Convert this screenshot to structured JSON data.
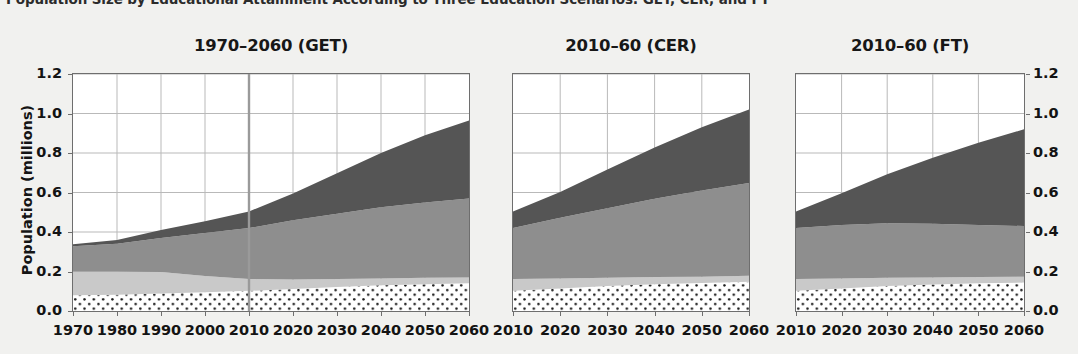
{
  "figure": {
    "title": "Population Size by Educational Attainment According to Three Education Scenarios: GET, CER, and FT",
    "y_axis_label": "Population (millions)",
    "background_color": "#f1f1ef",
    "panel_background": "#ffffff",
    "axis_color": "#6e6e6e",
    "gridline_color": "#b9b9b9"
  },
  "legend_colors": {
    "no_education_or_primary": "#ffffff-with-black-dots",
    "lower_secondary": "#c9c9c9",
    "upper_secondary": "#8e8e8e",
    "post_secondary": "#555555"
  },
  "chart_data": {
    "type": "area",
    "title": "Population Size by Educational Attainment According to Three Education Scenarios: GET, CER, and FT",
    "xlabel": "",
    "ylabel": "Population (millions)",
    "ylim": [
      0.0,
      1.2
    ],
    "yticks": [
      "0.0",
      "0.2",
      "0.4",
      "0.6",
      "0.8",
      "1.0",
      "1.2"
    ],
    "ytick_values": [
      0.0,
      0.2,
      0.4,
      0.6,
      0.8,
      1.0,
      1.2
    ],
    "grid": true,
    "legend_position": "none",
    "stacked": true,
    "series_order": [
      "No Education / Primary",
      "Lower Secondary",
      "Upper Secondary",
      "Post Secondary"
    ],
    "annotation_vline": {
      "panel": "GET",
      "x": 2010,
      "color": "#9a9a9a",
      "note": "projection start"
    },
    "panels": [
      {
        "id": "GET",
        "title": "1970–2060 (GET)",
        "xlim": [
          1970,
          2060
        ],
        "xticks": [
          "1970",
          "1980",
          "1990",
          "2000",
          "2010",
          "2020",
          "2030",
          "2040",
          "2050",
          "2060"
        ],
        "x": [
          1970,
          1980,
          1990,
          2000,
          2010,
          2020,
          2030,
          2040,
          2050,
          2060
        ],
        "series": [
          {
            "name": "No Education / Primary",
            "fill": "dotted",
            "values": [
              0.08,
              0.082,
              0.088,
              0.095,
              0.102,
              0.112,
              0.122,
              0.13,
              0.136,
              0.14
            ]
          },
          {
            "name": "Lower Secondary",
            "fill": "#c9c9c9",
            "values": [
              0.12,
              0.118,
              0.11,
              0.082,
              0.06,
              0.048,
              0.04,
              0.035,
              0.032,
              0.03
            ]
          },
          {
            "name": "Upper Secondary",
            "fill": "#8e8e8e",
            "values": [
              0.128,
              0.14,
              0.172,
              0.218,
              0.258,
              0.3,
              0.33,
              0.36,
              0.382,
              0.4
            ]
          },
          {
            "name": "Post Secondary",
            "fill": "#555555",
            "values": [
              0.01,
              0.02,
              0.04,
              0.06,
              0.084,
              0.135,
              0.205,
              0.275,
              0.34,
              0.395
            ]
          }
        ],
        "totals": [
          0.338,
          0.36,
          0.41,
          0.455,
          0.504,
          0.595,
          0.697,
          0.8,
          0.89,
          0.965
        ]
      },
      {
        "id": "CER",
        "title": "2010–60 (CER)",
        "xlim": [
          2010,
          2060
        ],
        "xticks": [
          "2010",
          "2020",
          "2030",
          "2040",
          "2050",
          "2060"
        ],
        "x": [
          2010,
          2020,
          2030,
          2040,
          2050,
          2060
        ],
        "series": [
          {
            "name": "No Education / Primary",
            "fill": "dotted",
            "values": [
              0.102,
              0.114,
              0.126,
              0.136,
              0.142,
              0.148
            ]
          },
          {
            "name": "Lower Secondary",
            "fill": "#c9c9c9",
            "values": [
              0.06,
              0.05,
              0.042,
              0.036,
              0.032,
              0.03
            ]
          },
          {
            "name": "Upper Secondary",
            "fill": "#8e8e8e",
            "values": [
              0.258,
              0.308,
              0.352,
              0.396,
              0.436,
              0.47
            ]
          },
          {
            "name": "Post Secondary",
            "fill": "#555555",
            "values": [
              0.084,
              0.13,
              0.196,
              0.26,
              0.32,
              0.372
            ]
          }
        ],
        "totals": [
          0.504,
          0.602,
          0.716,
          0.828,
          0.93,
          1.02
        ]
      },
      {
        "id": "FT",
        "title": "2010–60 (FT)",
        "xlim": [
          2010,
          2060
        ],
        "xticks": [
          "2010",
          "2020",
          "2030",
          "2040",
          "2050",
          "2060"
        ],
        "x": [
          2010,
          2020,
          2030,
          2040,
          2050,
          2060
        ],
        "series": [
          {
            "name": "No Education / Primary",
            "fill": "dotted",
            "values": [
              0.102,
              0.114,
              0.126,
              0.134,
              0.14,
              0.144
            ]
          },
          {
            "name": "Lower Secondary",
            "fill": "#c9c9c9",
            "values": [
              0.06,
              0.05,
              0.042,
              0.036,
              0.032,
              0.03
            ]
          },
          {
            "name": "Upper Secondary",
            "fill": "#8e8e8e",
            "values": [
              0.258,
              0.272,
              0.276,
              0.272,
              0.264,
              0.256
            ]
          },
          {
            "name": "Post Secondary",
            "fill": "#555555",
            "values": [
              0.084,
              0.16,
              0.248,
              0.334,
              0.416,
              0.49
            ]
          }
        ],
        "totals": [
          0.504,
          0.596,
          0.692,
          0.776,
          0.852,
          0.92
        ]
      }
    ]
  }
}
